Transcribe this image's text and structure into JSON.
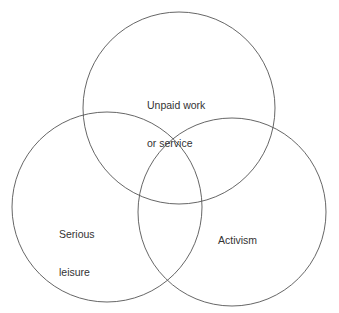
{
  "diagram": {
    "type": "venn",
    "stroke_color": "#555555",
    "background": "#ffffff",
    "sets": [
      {
        "id": "unpaid",
        "line1": "Unpaid work",
        "line2": "or service",
        "cx": 179,
        "cy": 108,
        "r": 96
      },
      {
        "id": "leisure",
        "line1": "Serious",
        "line2": "leisure",
        "cx": 107,
        "cy": 207,
        "r": 95
      },
      {
        "id": "activism",
        "line1": "Activism",
        "line2": "",
        "cx": 232,
        "cy": 212,
        "r": 94
      }
    ]
  }
}
